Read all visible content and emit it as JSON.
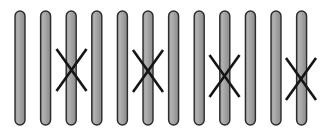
{
  "figure": {
    "width": 326,
    "height": 135,
    "background_color": "#ffffff"
  },
  "style": {
    "bar_fill_color": "#9a9a9a",
    "bar_fill_light": "#b5b5b5",
    "bar_stroke_color": "#2b2b2b",
    "bar_stroke_width": 1.4,
    "bar_width": 10,
    "bar_corner_radius": 5,
    "cross_stroke_color": "#151515",
    "cross_stroke_width": 2.6
  },
  "bars": [
    {
      "id": "bar-1",
      "label": "1",
      "x": 15.0,
      "y": 11,
      "height": 114
    },
    {
      "id": "bar-2",
      "label": "2",
      "x": 40.6,
      "y": 11,
      "height": 114
    },
    {
      "id": "bar-3",
      "label": "3",
      "x": 66.2,
      "y": 11,
      "height": 114
    },
    {
      "id": "bar-4",
      "label": "4",
      "x": 91.8,
      "y": 11,
      "height": 114
    },
    {
      "id": "bar-5",
      "label": "5",
      "x": 117.4,
      "y": 11,
      "height": 114
    },
    {
      "id": "bar-6",
      "label": "6",
      "x": 143.0,
      "y": 11,
      "height": 114
    },
    {
      "id": "bar-7",
      "label": "7",
      "x": 168.6,
      "y": 11,
      "height": 114
    },
    {
      "id": "bar-8",
      "label": "8",
      "x": 194.2,
      "y": 11,
      "height": 114
    },
    {
      "id": "bar-9",
      "label": "9",
      "x": 219.8,
      "y": 11,
      "height": 114
    },
    {
      "id": "bar-10",
      "label": "10",
      "x": 245.4,
      "y": 11,
      "height": 114
    },
    {
      "id": "bar-11",
      "label": "11",
      "x": 271.0,
      "y": 11,
      "height": 114
    },
    {
      "id": "bar-12",
      "label": "12",
      "x": 296.6,
      "y": 11,
      "height": 114
    }
  ],
  "crossovers": [
    {
      "id": "crossover-1",
      "label": "1",
      "on_bar": "bar-3",
      "cx": 71.5,
      "cy": 70,
      "half_width": 15,
      "half_height": 21
    },
    {
      "id": "crossover-2",
      "label": "2",
      "on_bar": "bar-6",
      "cx": 148.0,
      "cy": 71,
      "half_width": 15,
      "half_height": 21
    },
    {
      "id": "crossover-3",
      "label": "3",
      "on_bar": "bar-9",
      "cx": 224.5,
      "cy": 76,
      "half_width": 15,
      "half_height": 21
    },
    {
      "id": "crossover-4",
      "label": "4",
      "on_bar": "bar-12",
      "cx": 301.0,
      "cy": 79,
      "half_width": 15,
      "half_height": 21
    }
  ]
}
